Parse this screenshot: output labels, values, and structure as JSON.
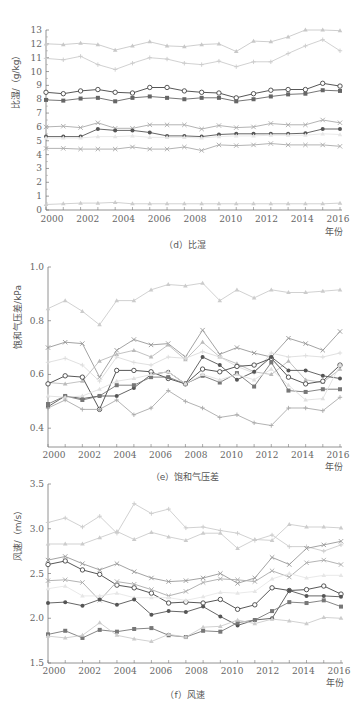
{
  "chart_data": [
    {
      "type": "line",
      "id": "d",
      "caption": "（d）比湿",
      "ylabel": "比湿/（g/kg）",
      "xlabel": "年份",
      "ylim": [
        0,
        13
      ],
      "yticks": [
        0,
        1,
        2,
        3,
        4,
        5,
        6,
        7,
        8,
        9,
        10,
        11,
        12,
        13
      ],
      "xtick_labels": [
        "2000",
        "2002",
        "2004",
        "2006",
        "2008",
        "2010",
        "2012",
        "2014",
        "2016"
      ],
      "x_points": 18,
      "grid": false,
      "legend": "none",
      "series": [
        {
          "name": "s1",
          "marker": "triangle",
          "color": "#c8c8c8",
          "values": [
            12.0,
            11.95,
            12.05,
            11.95,
            11.55,
            11.85,
            12.15,
            11.85,
            11.8,
            11.95,
            12.0,
            11.45,
            12.2,
            12.15,
            12.5,
            13.0,
            13.0,
            12.95
          ]
        },
        {
          "name": "s2",
          "marker": "plus",
          "color": "#cccccc",
          "values": [
            10.95,
            10.85,
            11.1,
            10.5,
            10.15,
            10.6,
            11.0,
            10.9,
            10.6,
            10.5,
            10.75,
            10.35,
            10.7,
            10.7,
            11.3,
            11.85,
            12.3,
            11.5
          ]
        },
        {
          "name": "s3",
          "marker": "open-circle",
          "color": "#444444",
          "values": [
            8.5,
            8.4,
            8.6,
            8.7,
            8.5,
            8.45,
            8.85,
            8.85,
            8.6,
            8.5,
            8.45,
            8.1,
            8.4,
            8.65,
            8.7,
            8.7,
            9.15,
            8.95
          ]
        },
        {
          "name": "s4",
          "marker": "square",
          "color": "#666666",
          "values": [
            7.95,
            7.9,
            8.05,
            8.1,
            7.85,
            8.1,
            8.2,
            8.1,
            8.0,
            8.1,
            8.1,
            7.85,
            8.0,
            8.2,
            8.35,
            8.4,
            8.65,
            8.6
          ]
        },
        {
          "name": "s5",
          "marker": "x",
          "color": "#aaaaaa",
          "values": [
            6.0,
            6.05,
            5.95,
            6.3,
            5.9,
            5.9,
            6.15,
            6.15,
            6.15,
            5.85,
            6.1,
            5.95,
            6.0,
            6.25,
            6.15,
            6.15,
            6.5,
            6.3
          ]
        },
        {
          "name": "s6",
          "marker": "dot",
          "color": "#555555",
          "values": [
            5.3,
            5.3,
            5.3,
            5.85,
            5.75,
            5.75,
            5.6,
            5.35,
            5.35,
            5.3,
            5.45,
            5.5,
            5.5,
            5.5,
            5.5,
            5.55,
            5.85,
            5.85
          ]
        },
        {
          "name": "s7",
          "marker": "triangle",
          "color": "#e6e6e6",
          "values": [
            5.2,
            5.2,
            5.2,
            5.3,
            5.3,
            5.35,
            5.25,
            5.25,
            5.25,
            5.2,
            5.3,
            5.35,
            5.35,
            5.4,
            5.4,
            5.4,
            5.5,
            5.45
          ]
        },
        {
          "name": "s8",
          "marker": "x",
          "color": "#aaaaaa",
          "values": [
            4.45,
            4.45,
            4.4,
            4.4,
            4.4,
            4.55,
            4.4,
            4.4,
            4.55,
            4.3,
            4.7,
            4.65,
            4.7,
            4.8,
            4.7,
            4.7,
            4.7,
            4.6
          ]
        },
        {
          "name": "s9",
          "marker": "triangle",
          "color": "#cccccc",
          "values": [
            0.4,
            0.45,
            0.5,
            0.5,
            0.55,
            0.45,
            0.45,
            0.45,
            0.45,
            0.45,
            0.45,
            0.45,
            0.45,
            0.45,
            0.45,
            0.45,
            0.45,
            0.5
          ]
        }
      ]
    },
    {
      "type": "line",
      "id": "e",
      "caption": "（e）饱和气压差",
      "ylabel": "饱和气压差/kPa",
      "xlabel": "年份",
      "ylim": [
        0.33,
        1.0
      ],
      "yticks": [
        0.4,
        0.6,
        0.8,
        1.0
      ],
      "ytick_labels": [
        "0.4",
        "0.6",
        "0.8",
        "1.0"
      ],
      "xtick_labels": [
        "2000",
        "2002",
        "2004",
        "2006",
        "2008",
        "2010",
        "2012",
        "2014",
        "2016"
      ],
      "x_points": 18,
      "grid": false,
      "legend": "none",
      "series": [
        {
          "name": "s1",
          "marker": "triangle",
          "color": "#cccccc",
          "values": [
            0.845,
            0.875,
            0.835,
            0.785,
            0.875,
            0.875,
            0.915,
            0.935,
            0.93,
            0.94,
            0.875,
            0.915,
            0.885,
            0.915,
            0.905,
            0.905,
            0.91,
            0.915
          ]
        },
        {
          "name": "s2",
          "marker": "x",
          "color": "#999999",
          "values": [
            0.7,
            0.72,
            0.715,
            0.59,
            0.69,
            0.73,
            0.71,
            0.715,
            0.665,
            0.765,
            0.675,
            0.7,
            0.68,
            0.665,
            0.735,
            0.715,
            0.69,
            0.76
          ]
        },
        {
          "name": "s3",
          "marker": "triangle",
          "color": "#bbbbbb",
          "values": [
            0.57,
            0.565,
            0.575,
            0.65,
            0.675,
            0.69,
            0.665,
            0.71,
            0.655,
            0.72,
            0.665,
            0.64,
            0.61,
            0.6,
            0.65,
            0.58,
            0.57,
            0.62
          ]
        },
        {
          "name": "s4",
          "marker": "plus",
          "color": "#dddddd",
          "values": [
            0.645,
            0.66,
            0.635,
            0.575,
            0.665,
            0.645,
            0.635,
            0.665,
            0.66,
            0.685,
            0.665,
            0.63,
            0.605,
            0.68,
            0.665,
            0.67,
            0.665,
            0.68
          ]
        },
        {
          "name": "s5",
          "marker": "open-circle",
          "color": "#444444",
          "values": [
            0.565,
            0.595,
            0.59,
            0.47,
            0.615,
            0.615,
            0.61,
            0.585,
            0.565,
            0.62,
            0.61,
            0.63,
            0.635,
            0.66,
            0.59,
            0.565,
            0.575,
            0.635
          ]
        },
        {
          "name": "s6",
          "marker": "dot",
          "color": "#555555",
          "values": [
            0.48,
            0.52,
            0.51,
            0.52,
            0.52,
            0.55,
            0.6,
            0.61,
            0.565,
            0.665,
            0.635,
            0.58,
            0.61,
            0.665,
            0.615,
            0.615,
            0.595,
            0.585
          ]
        },
        {
          "name": "s7",
          "marker": "square",
          "color": "#777777",
          "values": [
            0.49,
            0.52,
            0.505,
            0.52,
            0.56,
            0.56,
            0.59,
            0.59,
            0.565,
            0.595,
            0.57,
            0.605,
            0.555,
            0.645,
            0.54,
            0.535,
            0.545,
            0.545
          ]
        },
        {
          "name": "s8",
          "marker": "triangle",
          "color": "#e0e0e0",
          "values": [
            0.52,
            0.515,
            0.52,
            0.545,
            0.575,
            0.585,
            0.6,
            0.61,
            0.565,
            0.6,
            0.58,
            0.6,
            0.58,
            0.62,
            0.56,
            0.505,
            0.51,
            0.635
          ]
        },
        {
          "name": "s9",
          "marker": "plus",
          "color": "#aaaaaa",
          "values": [
            0.475,
            0.505,
            0.47,
            0.47,
            0.505,
            0.45,
            0.475,
            0.54,
            0.5,
            0.475,
            0.44,
            0.45,
            0.42,
            0.41,
            0.475,
            0.475,
            0.465,
            0.515
          ]
        }
      ]
    },
    {
      "type": "line",
      "id": "f",
      "caption": "（f）风速",
      "ylabel": "风速/（m/s）",
      "xlabel": "年份",
      "ylim": [
        1.5,
        3.5
      ],
      "yticks": [
        1.5,
        2.0,
        2.5,
        3.0,
        3.5
      ],
      "ytick_labels": [
        "1.5",
        "2.0",
        "2.5",
        "3.0",
        "3.5"
      ],
      "xtick_labels": [
        "2000",
        "2002",
        "2004",
        "2006",
        "2008",
        "2010",
        "2012",
        "2014",
        "2016"
      ],
      "x_points": 18,
      "grid": false,
      "legend": "none",
      "series": [
        {
          "name": "s1",
          "marker": "plus",
          "color": "#cccccc",
          "values": [
            3.07,
            3.12,
            3.02,
            3.14,
            2.95,
            3.28,
            3.17,
            3.22,
            3.01,
            3.02,
            2.98,
            2.95,
            2.87,
            2.93,
            2.8,
            2.8,
            2.75,
            2.82
          ]
        },
        {
          "name": "s2",
          "marker": "triangle",
          "color": "#cccccc",
          "values": [
            2.83,
            2.83,
            2.83,
            2.9,
            2.97,
            2.88,
            2.96,
            2.91,
            2.87,
            2.95,
            2.95,
            2.78,
            2.88,
            2.87,
            3.05,
            3.02,
            3.02,
            3.01
          ]
        },
        {
          "name": "s3",
          "marker": "x",
          "color": "#999999",
          "values": [
            2.65,
            2.69,
            2.61,
            2.54,
            2.61,
            2.52,
            2.45,
            2.41,
            2.42,
            2.45,
            2.5,
            2.39,
            2.45,
            2.68,
            2.6,
            2.78,
            2.82,
            2.86
          ]
        },
        {
          "name": "s4",
          "marker": "open-circle",
          "color": "#444444",
          "values": [
            2.6,
            2.64,
            2.54,
            2.49,
            2.37,
            2.34,
            2.28,
            2.17,
            2.18,
            2.17,
            2.21,
            2.1,
            2.15,
            2.34,
            2.31,
            2.32,
            2.36,
            2.27
          ]
        },
        {
          "name": "s5",
          "marker": "x",
          "color": "#aaaaaa",
          "values": [
            2.42,
            2.43,
            2.4,
            2.2,
            2.41,
            2.38,
            2.32,
            2.25,
            2.3,
            2.4,
            2.44,
            2.43,
            2.41,
            2.53,
            2.46,
            2.62,
            2.65,
            2.6
          ]
        },
        {
          "name": "s6",
          "marker": "triangle",
          "color": "#e6e6e6",
          "values": [
            2.33,
            2.36,
            2.25,
            2.25,
            2.28,
            2.23,
            2.23,
            2.23,
            2.2,
            2.24,
            2.29,
            2.28,
            2.3,
            2.44,
            2.5,
            2.45,
            2.48,
            2.48
          ]
        },
        {
          "name": "s7",
          "marker": "dot",
          "color": "#555555",
          "values": [
            2.17,
            2.18,
            2.14,
            2.21,
            2.15,
            2.21,
            2.04,
            2.08,
            2.07,
            2.13,
            2.02,
            1.92,
            1.98,
            2.0,
            2.31,
            2.25,
            2.25,
            2.24
          ]
        },
        {
          "name": "s8",
          "marker": "square",
          "color": "#777777",
          "values": [
            1.82,
            1.86,
            1.78,
            1.87,
            1.85,
            1.88,
            1.89,
            1.81,
            1.79,
            1.86,
            1.85,
            1.95,
            1.98,
            2.08,
            2.18,
            2.17,
            2.2,
            2.13
          ]
        },
        {
          "name": "s9",
          "marker": "triangle",
          "color": "#cccccc",
          "values": [
            1.8,
            1.78,
            1.81,
            1.95,
            1.81,
            1.77,
            1.74,
            1.82,
            1.79,
            1.9,
            1.91,
            1.98,
            1.94,
            1.99,
            1.97,
            1.94,
            2.01,
            2.0
          ]
        }
      ]
    }
  ],
  "layout": {
    "panels": [
      {
        "id": "d",
        "x0": 46,
        "x1": 340,
        "y_top": 30,
        "y_bottom": 210,
        "caption_y": 248,
        "xtick_y": 222,
        "xlabel_y": 235
      },
      {
        "id": "e",
        "x0": 48,
        "x1": 340,
        "y_top": 267,
        "y_bottom": 447,
        "caption_y": 480,
        "xtick_y": 458,
        "xlabel_y": 470
      },
      {
        "id": "f",
        "x0": 48,
        "x1": 341,
        "y_top": 484,
        "y_bottom": 663,
        "caption_y": 698,
        "xtick_y": 674,
        "xlabel_y": 686
      }
    ]
  }
}
